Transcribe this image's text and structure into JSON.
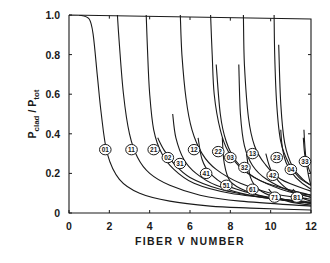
{
  "chart_data": {
    "type": "line",
    "title": "",
    "xlabel": "FIBER V NUMBER",
    "ylabel": "P_clad / P_tot",
    "ylabel_main": "P",
    "ylabel_num_sub": "clad",
    "ylabel_den_sub": "tot",
    "xlim": [
      0,
      12
    ],
    "ylim": [
      0,
      1.0
    ],
    "x_ticks": [
      "0",
      "2",
      "4",
      "6",
      "8",
      "10",
      "12"
    ],
    "y_ticks": [
      "0",
      "0.2",
      "0.4",
      "0.6",
      "0.8",
      "1.0"
    ],
    "grid": false,
    "legend": "none (modes labeled inline with circled numbers)",
    "series": [
      {
        "name": "01",
        "cutoff": 0.0,
        "label_at": [
          1.8,
          0.32
        ],
        "points": [
          [
            0.5,
            1.0
          ],
          [
            1.0,
            0.98
          ],
          [
            1.2,
            0.9
          ],
          [
            1.4,
            0.7
          ],
          [
            1.6,
            0.5
          ],
          [
            1.9,
            0.3
          ],
          [
            2.5,
            0.17
          ],
          [
            3.5,
            0.1
          ],
          [
            5,
            0.06
          ],
          [
            7,
            0.035
          ],
          [
            9,
            0.025
          ],
          [
            12,
            0.015
          ]
        ]
      },
      {
        "name": "11",
        "cutoff": 2.405,
        "label_at": [
          3.1,
          0.32
        ],
        "points": [
          [
            2.4,
            1.0
          ],
          [
            2.5,
            0.85
          ],
          [
            2.7,
            0.6
          ],
          [
            3.0,
            0.4
          ],
          [
            3.4,
            0.28
          ],
          [
            4.0,
            0.2
          ],
          [
            5,
            0.14
          ],
          [
            6.5,
            0.09
          ],
          [
            8.5,
            0.06
          ],
          [
            12,
            0.035
          ]
        ]
      },
      {
        "name": "21",
        "cutoff": 3.83,
        "label_at": [
          4.2,
          0.32
        ],
        "points": [
          [
            3.83,
            1.0
          ],
          [
            3.9,
            0.8
          ],
          [
            4.0,
            0.6
          ],
          [
            4.2,
            0.42
          ],
          [
            4.6,
            0.3
          ],
          [
            5.2,
            0.22
          ],
          [
            6.2,
            0.15
          ],
          [
            8,
            0.1
          ],
          [
            12,
            0.05
          ]
        ]
      },
      {
        "name": "02",
        "cutoff": 3.83,
        "label_at": [
          4.9,
          0.28
        ],
        "points": [
          [
            4.4,
            0.38
          ],
          [
            4.7,
            0.32
          ],
          [
            5.2,
            0.25
          ],
          [
            6,
            0.18
          ],
          [
            7.5,
            0.12
          ],
          [
            9.5,
            0.08
          ],
          [
            12,
            0.05
          ]
        ]
      },
      {
        "name": "31",
        "cutoff": 5.14,
        "label_at": [
          5.5,
          0.25
        ],
        "points": [
          [
            5.14,
            0.5
          ],
          [
            5.3,
            0.38
          ],
          [
            5.7,
            0.27
          ],
          [
            6.3,
            0.2
          ],
          [
            7.3,
            0.14
          ],
          [
            9,
            0.09
          ],
          [
            12,
            0.055
          ]
        ]
      },
      {
        "name": "12",
        "cutoff": 5.52,
        "label_at": [
          6.2,
          0.32
        ],
        "points": [
          [
            5.52,
            1.0
          ],
          [
            5.6,
            0.8
          ],
          [
            5.8,
            0.58
          ],
          [
            6.1,
            0.42
          ],
          [
            6.6,
            0.3
          ],
          [
            7.3,
            0.22
          ],
          [
            8.5,
            0.15
          ],
          [
            10,
            0.1
          ],
          [
            12,
            0.07
          ]
        ]
      },
      {
        "name": "41",
        "cutoff": 6.38,
        "label_at": [
          6.8,
          0.2
        ],
        "points": [
          [
            6.4,
            0.38
          ],
          [
            6.6,
            0.27
          ],
          [
            7,
            0.2
          ],
          [
            7.8,
            0.14
          ],
          [
            9,
            0.1
          ],
          [
            10.5,
            0.07
          ],
          [
            12,
            0.05
          ]
        ]
      },
      {
        "name": "22",
        "cutoff": 7.02,
        "label_at": [
          7.4,
          0.31
        ],
        "points": [
          [
            7.02,
            1.0
          ],
          [
            7.1,
            0.8
          ],
          [
            7.2,
            0.6
          ],
          [
            7.5,
            0.42
          ],
          [
            7.9,
            0.31
          ],
          [
            8.6,
            0.22
          ],
          [
            9.8,
            0.15
          ],
          [
            12,
            0.09
          ]
        ]
      },
      {
        "name": "03",
        "cutoff": 7.02,
        "label_at": [
          8.0,
          0.28
        ],
        "points": [
          [
            7.3,
            0.75
          ],
          [
            7.5,
            0.5
          ],
          [
            7.8,
            0.36
          ],
          [
            8.3,
            0.26
          ],
          [
            9.2,
            0.18
          ],
          [
            10.5,
            0.12
          ],
          [
            12,
            0.08
          ]
        ]
      },
      {
        "name": "51",
        "cutoff": 7.59,
        "label_at": [
          7.8,
          0.14
        ],
        "points": [
          [
            7.6,
            0.38
          ],
          [
            7.7,
            0.25
          ],
          [
            8.0,
            0.16
          ],
          [
            8.8,
            0.11
          ],
          [
            10,
            0.075
          ],
          [
            12,
            0.05
          ]
        ]
      },
      {
        "name": "32",
        "cutoff": 8.42,
        "label_at": [
          8.7,
          0.23
        ],
        "points": [
          [
            8.42,
            0.75
          ],
          [
            8.5,
            0.5
          ],
          [
            8.7,
            0.34
          ],
          [
            9.1,
            0.24
          ],
          [
            9.8,
            0.17
          ],
          [
            11,
            0.11
          ],
          [
            12,
            0.09
          ]
        ]
      },
      {
        "name": "13",
        "cutoff": 8.65,
        "label_at": [
          9.1,
          0.3
        ],
        "points": [
          [
            8.65,
            1.0
          ],
          [
            8.7,
            0.75
          ],
          [
            8.9,
            0.48
          ],
          [
            9.2,
            0.34
          ],
          [
            9.7,
            0.25
          ],
          [
            10.5,
            0.17
          ],
          [
            12,
            0.11
          ]
        ]
      },
      {
        "name": "61",
        "cutoff": 8.77,
        "label_at": [
          9.1,
          0.12
        ],
        "points": [
          [
            8.8,
            0.3
          ],
          [
            9.0,
            0.18
          ],
          [
            9.4,
            0.12
          ],
          [
            10.2,
            0.08
          ],
          [
            11.2,
            0.06
          ],
          [
            12,
            0.05
          ]
        ]
      },
      {
        "name": "42",
        "cutoff": 9.76,
        "label_at": [
          10.1,
          0.19
        ],
        "points": [
          [
            9.76,
            0.3
          ],
          [
            10.0,
            0.22
          ],
          [
            10.4,
            0.16
          ],
          [
            11,
            0.11
          ],
          [
            12,
            0.08
          ]
        ]
      },
      {
        "name": "23",
        "cutoff": 10.17,
        "label_at": [
          10.3,
          0.28
        ],
        "points": [
          [
            10.17,
            1.0
          ],
          [
            10.2,
            0.8
          ],
          [
            10.3,
            0.55
          ],
          [
            10.5,
            0.36
          ],
          [
            10.9,
            0.25
          ],
          [
            11.4,
            0.18
          ],
          [
            12,
            0.14
          ]
        ]
      },
      {
        "name": "71",
        "cutoff": 9.94,
        "label_at": [
          10.2,
          0.08
        ],
        "points": [
          [
            9.9,
            0.12
          ],
          [
            10.3,
            0.08
          ],
          [
            11,
            0.055
          ],
          [
            12,
            0.04
          ]
        ]
      },
      {
        "name": "04",
        "cutoff": 10.17,
        "label_at": [
          11.0,
          0.22
        ],
        "points": [
          [
            10.4,
            0.85
          ],
          [
            10.5,
            0.55
          ],
          [
            10.7,
            0.35
          ],
          [
            11.1,
            0.23
          ],
          [
            11.6,
            0.17
          ],
          [
            12,
            0.14
          ]
        ]
      },
      {
        "name": "33",
        "cutoff": 11.62,
        "label_at": [
          11.7,
          0.26
        ],
        "points": [
          [
            11.62,
            0.38
          ],
          [
            11.7,
            0.29
          ],
          [
            11.9,
            0.22
          ],
          [
            12,
            0.2
          ]
        ]
      },
      {
        "name": "81",
        "cutoff": 11.09,
        "label_at": [
          11.3,
          0.08
        ],
        "points": [
          [
            11.1,
            0.12
          ],
          [
            11.5,
            0.08
          ],
          [
            12,
            0.06
          ]
        ]
      }
    ],
    "extra_curves_near_cutoff": [
      10.5,
      11.65
    ]
  }
}
